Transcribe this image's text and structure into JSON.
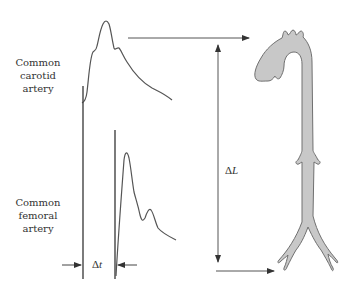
{
  "labels": {
    "carotid": {
      "line1": "Common",
      "line2": "carotid",
      "line3": "artery"
    },
    "femoral": {
      "line1": "Common",
      "line2": "femoral",
      "line3": "artery"
    }
  },
  "symbols": {
    "delta_t_prefix": "Δ",
    "delta_t_var": "t",
    "delta_l_prefix": "Δ",
    "delta_l_var": "L"
  },
  "colors": {
    "stroke": "#555555",
    "aorta_fill": "#c8c8c8",
    "aorta_stroke": "#707070",
    "text": "#333333"
  }
}
